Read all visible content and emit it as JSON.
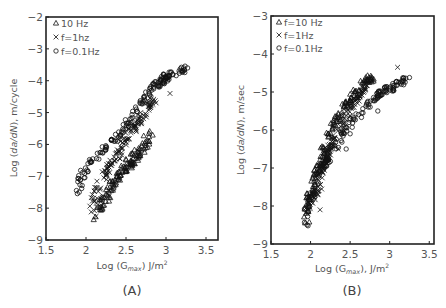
{
  "chart_data": [
    {
      "id": "A",
      "type": "scatter",
      "panel_label": "(A)",
      "xlabel": "Log (G_max) J/m²",
      "xlabel_parts": {
        "pre": "Log (G",
        "sub": "max",
        "post": ") J/m",
        "sup": "2"
      },
      "ylabel": "Log (da/dN), m/cycle",
      "ylabel_parts": {
        "pre": "Log (",
        "ital": "da/dN",
        "post": "), m/cycle"
      },
      "xlim": [
        1.5,
        3.65
      ],
      "ylim": [
        -9,
        -2
      ],
      "xticks": [
        "1.5",
        "2",
        "2.5",
        "3",
        "3.5"
      ],
      "xtick_values": [
        1.5,
        2,
        2.5,
        3,
        3.5
      ],
      "yticks": [
        "-2",
        "-3",
        "-4",
        "-5",
        "-6",
        "-7",
        "-8",
        "-9"
      ],
      "ytick_values": [
        -2,
        -3,
        -4,
        -5,
        -6,
        -7,
        -8,
        -9
      ],
      "grid": false,
      "legend_position": "top-left",
      "series": [
        {
          "name": "10 Hz",
          "marker": "triangle",
          "trend": [
            [
              2.12,
              -8.3
            ],
            [
              2.2,
              -7.9
            ],
            [
              2.3,
              -7.4
            ],
            [
              2.4,
              -7.0
            ],
            [
              2.5,
              -6.7
            ],
            [
              2.6,
              -6.4
            ],
            [
              2.7,
              -6.1
            ],
            [
              2.8,
              -5.7
            ]
          ],
          "spread": 0.18,
          "count": 130
        },
        {
          "name": "f=1hz",
          "marker": "x",
          "trend": [
            [
              2.08,
              -8.3
            ],
            [
              2.1,
              -7.8
            ],
            [
              2.15,
              -7.3
            ],
            [
              2.25,
              -6.9
            ],
            [
              2.35,
              -6.5
            ],
            [
              2.45,
              -6.1
            ],
            [
              2.55,
              -5.7
            ],
            [
              2.65,
              -5.3
            ],
            [
              2.75,
              -4.9
            ],
            [
              2.85,
              -4.6
            ]
          ],
          "spread": 0.15,
          "count": 140,
          "outliers": [
            [
              3.05,
              -4.4
            ]
          ]
        },
        {
          "name": "f=0.1Hz",
          "marker": "circle",
          "trend": [
            [
              1.92,
              -7.6
            ],
            [
              1.93,
              -7.1
            ],
            [
              1.97,
              -6.9
            ],
            [
              2.05,
              -6.6
            ],
            [
              2.15,
              -6.3
            ],
            [
              2.3,
              -6.0
            ],
            [
              2.45,
              -5.6
            ],
            [
              2.6,
              -5.0
            ],
            [
              2.75,
              -4.5
            ],
            [
              2.85,
              -4.2
            ],
            [
              2.95,
              -4.0
            ],
            [
              3.05,
              -3.8
            ],
            [
              3.25,
              -3.6
            ]
          ],
          "spread": 0.14,
          "count": 170,
          "outliers": [
            [
              2.55,
              -5.2
            ],
            [
              2.35,
              -5.9
            ],
            [
              3.27,
              -3.6
            ]
          ]
        }
      ]
    },
    {
      "id": "B",
      "type": "scatter",
      "panel_label": "(B)",
      "xlabel": "Log (G_max), J/m²",
      "xlabel_parts": {
        "pre": "Log (G",
        "sub": "max",
        "post": "), J/m",
        "sup": "2"
      },
      "ylabel": "Log (da/dN), m/sec",
      "ylabel_parts": {
        "pre": "Log (",
        "ital": "da/dN",
        "post": "), m/sec"
      },
      "xlim": [
        1.5,
        3.56
      ],
      "ylim": [
        -9,
        -3
      ],
      "xticks": [
        "1.5",
        "2",
        "2.5",
        "3",
        "3.5"
      ],
      "xtick_values": [
        1.5,
        2,
        2.5,
        3,
        3.5
      ],
      "yticks": [
        "-3",
        "-4",
        "-5",
        "-6",
        "-7",
        "-8",
        "-9"
      ],
      "ytick_values": [
        -3,
        -4,
        -5,
        -6,
        -7,
        -8,
        -9
      ],
      "grid": false,
      "legend_position": "top-left",
      "series": [
        {
          "name": "f=10 Hz",
          "marker": "triangle",
          "trend": [
            [
              1.95,
              -8.4
            ],
            [
              1.97,
              -7.8
            ],
            [
              2.05,
              -7.3
            ],
            [
              2.15,
              -6.6
            ],
            [
              2.25,
              -6.0
            ],
            [
              2.4,
              -5.5
            ],
            [
              2.55,
              -5.1
            ],
            [
              2.7,
              -4.7
            ],
            [
              2.78,
              -4.6
            ]
          ],
          "spread": 0.13,
          "count": 150
        },
        {
          "name": "f=1Hz",
          "marker": "x",
          "trend": [
            [
              1.95,
              -8.3
            ],
            [
              2.0,
              -7.8
            ],
            [
              2.1,
              -7.6
            ],
            [
              2.15,
              -7.0
            ],
            [
              2.25,
              -6.4
            ],
            [
              2.4,
              -5.8
            ],
            [
              2.55,
              -5.3
            ],
            [
              2.7,
              -4.9
            ]
          ],
          "spread": 0.13,
          "count": 140,
          "outliers": [
            [
              3.1,
              -4.35
            ],
            [
              2.3,
              -6.2
            ],
            [
              2.35,
              -6.5
            ],
            [
              2.12,
              -8.1
            ]
          ]
        },
        {
          "name": "f=0.1Hz",
          "marker": "circle",
          "trend": [
            [
              1.93,
              -8.6
            ],
            [
              1.95,
              -8.0
            ],
            [
              2.05,
              -7.5
            ],
            [
              2.15,
              -7.0
            ],
            [
              2.25,
              -6.6
            ],
            [
              2.4,
              -6.1
            ],
            [
              2.55,
              -5.7
            ],
            [
              2.75,
              -5.3
            ],
            [
              2.9,
              -5.0
            ],
            [
              3.05,
              -4.85
            ],
            [
              3.2,
              -4.65
            ]
          ],
          "spread": 0.13,
          "count": 170,
          "outliers": [
            [
              2.5,
              -6.1
            ],
            [
              2.85,
              -5.5
            ],
            [
              2.45,
              -6.5
            ],
            [
              3.25,
              -4.62
            ]
          ]
        }
      ]
    }
  ]
}
